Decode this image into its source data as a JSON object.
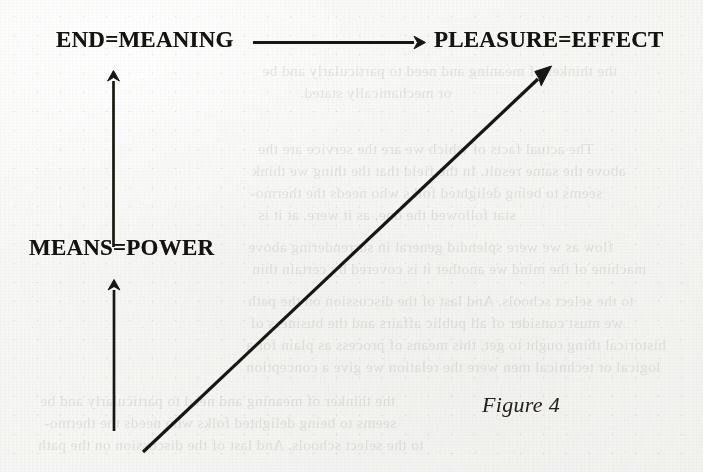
{
  "page": {
    "background_color": "#f7f7f5",
    "ink_color": "#15130f",
    "width": 703,
    "height": 472,
    "medium": "scanned book page"
  },
  "diagram": {
    "title": "Figure 4",
    "caption": "Figure 4",
    "nodes": [
      {
        "id": "end",
        "label": "END=MEANING",
        "x": 56,
        "y": 27
      },
      {
        "id": "pleasure",
        "label": "PLEASURE=EFFECT",
        "x": 434,
        "y": 27
      },
      {
        "id": "means",
        "label": "MEANS=POWER",
        "x": 29,
        "y": 235
      }
    ],
    "arrows": [
      {
        "id": "arrow-end-to-pleasure",
        "name": "horizontal-arrow",
        "from": "end",
        "to": "pleasure",
        "direction": "right",
        "x1": 253,
        "y1": 42,
        "x2": 423,
        "y2": 42
      },
      {
        "id": "arrow-means-to-end",
        "name": "upper-vertical-arrow",
        "from": "means",
        "to": "end",
        "direction": "up",
        "x1": 113,
        "y1": 246,
        "x2": 113,
        "y2": 72
      },
      {
        "id": "arrow-bottom-to-means",
        "name": "lower-vertical-arrow",
        "from": "",
        "to": "means",
        "direction": "up",
        "x1": 114,
        "y1": 430,
        "x2": 114,
        "y2": 281
      },
      {
        "id": "arrow-diagonal-to-pleasure",
        "name": "diagonal-arrow",
        "from": "",
        "to": "pleasure",
        "direction": "up-right",
        "x1": 143,
        "y1": 452,
        "x2": 551,
        "y2": 67
      }
    ]
  },
  "ghost_text": {
    "note": "faint mirrored show-through text from the reverse side of the page",
    "lines": [
      {
        "text": "the thinker of meaning and need to particularly and be",
        "x": 262,
        "y": 70,
        "size": 15.5
      },
      {
        "text": "or mechanically stated.",
        "x": 300,
        "y": 92,
        "size": 15.5
      },
      {
        "text": "The actual facts of which we are the service are the",
        "x": 258,
        "y": 148,
        "size": 15.5
      },
      {
        "text": "above the same result. In the field that the thing we think",
        "x": 252,
        "y": 170,
        "size": 15.5
      },
      {
        "text": "seems to being delighted folks who needs the thermo-",
        "x": 250,
        "y": 192,
        "size": 15.5
      },
      {
        "text": "stat followed the one, as it were, at it is",
        "x": 258,
        "y": 214,
        "size": 15.5
      },
      {
        "text": "flow as we were splendid general in surrendering above",
        "x": 248,
        "y": 246,
        "size": 15.5
      },
      {
        "text": "machine of the mind we another it is covered by certain thin",
        "x": 252,
        "y": 268,
        "size": 15.5
      },
      {
        "text": "to the select schools. And last of the discussion on the path",
        "x": 248,
        "y": 300,
        "size": 15.5
      },
      {
        "text": "we must consider of all public affairs and the business of",
        "x": 250,
        "y": 322,
        "size": 15.5
      },
      {
        "text": "historical thing ought to get, this means of process as plain for a",
        "x": 246,
        "y": 344,
        "size": 15.5
      },
      {
        "text": "logical or technical men were the relation we give a conception",
        "x": 246,
        "y": 366,
        "size": 15.5
      }
    ]
  }
}
